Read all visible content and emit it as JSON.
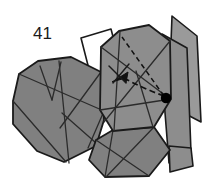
{
  "figure": {
    "kind": "origami-folding-diagram",
    "step_number": "41",
    "background_color": "#ffffff",
    "outline_color": "#1a1a1a",
    "crease_color": "#2b2b2b",
    "fill_shaded": "#808080",
    "fill_shaded_light": "#9a9a9a",
    "fill_shaded_mid": "#8d8d8d",
    "fill_unshaded": "#ffffff",
    "pivot_dot_color": "#000000",
    "annotation": {
      "pivot_label": "pivot-point",
      "fold_arrow_label": "fold-direction-arrow",
      "dashed_guide_label": "dashed-reference-line"
    }
  },
  "geometry": {
    "left_wing": "12,100 18,75 37,62 70,58 96,76 100,108 92,141 62,160 38,150 14,124",
    "left_wing_top_face": "18,75 37,62 70,58 96,76 60,95 30,92",
    "left_wing_creases": [
      "18,75 96,104",
      "37,62 46,95",
      "46,95 56,64",
      "56,64 62,160",
      "96,76 60,130",
      "96,104 84,140",
      "62,110 100,146"
    ],
    "center_panel": "100,108 100,46 118,32 148,26 168,40 170,98 152,128 112,132",
    "center_panel_creases": [
      "100,46 168,98",
      "168,40 104,120",
      "118,32 112,132",
      "100,108 170,98",
      "134,66 152,128"
    ],
    "lower_center_panel": "96,140 112,132 152,128 168,150 148,175 104,176 90,160",
    "lower_center_creases": [
      "112,132 104,176",
      "96,140 148,175",
      "152,128 104,176"
    ],
    "right_flap_tall": "172,16 196,34 200,120 178,108 172,40",
    "right_flap_lower": "168,40 186,48 190,150 170,160 168,98",
    "right_flap_base": "168,150 190,150 192,168 170,172",
    "white_face": "82,38 110,30 118,58 92,80",
    "pivot_dot": {
      "cx": 166,
      "cy": 98,
      "r": 5
    },
    "dashed_guides": [
      "166,98 122,37",
      "166,98 114,78"
    ],
    "fold_arrow": {
      "path": "166,98 142,84 120,76",
      "head": "113,80 126,74 123,84"
    },
    "small_tick_marks": [
      "110,68 124,82",
      "116,80 128,66"
    ],
    "step_number_pos": {
      "x": 33,
      "y": 38
    }
  }
}
